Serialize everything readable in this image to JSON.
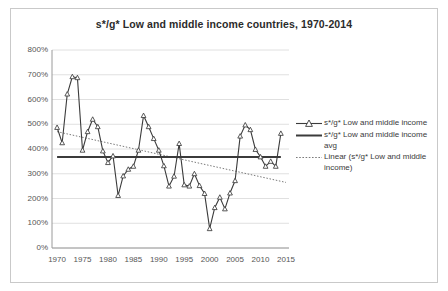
{
  "chart_data": {
    "type": "line",
    "title": "s*/g* Low and middle income countries, 1970-2014",
    "xlabel": "",
    "ylabel": "",
    "xlim": [
      1969,
      2015.6
    ],
    "ylim": [
      0,
      800
    ],
    "xticks": [
      "1970",
      "1975",
      "1980",
      "1985",
      "1990",
      "1995",
      "2000",
      "2005",
      "2010",
      "2015"
    ],
    "xtick_values": [
      1970,
      1975,
      1980,
      1985,
      1990,
      1995,
      2000,
      2005,
      2010,
      2015
    ],
    "yticks": [
      "0%",
      "100%",
      "200%",
      "300%",
      "400%",
      "500%",
      "600%",
      "700%",
      "800%"
    ],
    "ytick_values": [
      0,
      100,
      200,
      300,
      400,
      500,
      600,
      700,
      800
    ],
    "grid": true,
    "legend_position": "right",
    "x": [
      1970,
      1971,
      1972,
      1973,
      1974,
      1975,
      1976,
      1977,
      1978,
      1979,
      1980,
      1981,
      1982,
      1983,
      1984,
      1985,
      1986,
      1987,
      1988,
      1989,
      1990,
      1991,
      1992,
      1993,
      1994,
      1995,
      1996,
      1997,
      1998,
      1999,
      2000,
      2001,
      2002,
      2003,
      2004,
      2005,
      2006,
      2007,
      2008,
      2009,
      2010,
      2011,
      2012,
      2013,
      2014
    ],
    "series": [
      {
        "name": "s*/g* Low and middle income",
        "style": "line-markers",
        "marker": "triangle-open",
        "color": "#3b3b3b",
        "values": [
          487,
          425,
          622,
          692,
          688,
          395,
          470,
          520,
          490,
          392,
          345,
          372,
          212,
          291,
          318,
          330,
          395,
          535,
          490,
          442,
          395,
          332,
          250,
          290,
          422,
          255,
          250,
          300,
          252,
          220,
          78,
          163,
          205,
          158,
          222,
          272,
          452,
          497,
          478,
          398,
          368,
          330,
          350,
          330,
          463
        ]
      },
      {
        "name": "s*/g* Low and middle income avg",
        "style": "line",
        "color": "#3b3b3b",
        "constant": 368,
        "values": [
          368,
          368,
          368,
          368,
          368,
          368,
          368,
          368,
          368,
          368,
          368,
          368,
          368,
          368,
          368,
          368,
          368,
          368,
          368,
          368,
          368,
          368,
          368,
          368,
          368,
          368,
          368,
          368,
          368,
          368,
          368,
          368,
          368,
          368,
          368,
          368,
          368,
          368,
          368,
          368,
          368,
          368,
          368,
          368,
          368
        ]
      },
      {
        "name": "Linear (s*/g* Low and middle income)",
        "style": "dotted-trendline",
        "color": "#7a7a7a",
        "endpoints": [
          [
            1970,
            470
          ],
          [
            2015,
            265
          ]
        ]
      }
    ]
  },
  "legend": {
    "items": [
      {
        "label": "s*/g* Low and middle income",
        "key": "line-with-triangle-marker"
      },
      {
        "label": "s*/g* Low and middle income avg",
        "key": "solid-line"
      },
      {
        "label": "Linear (s*/g* Low and middle income)",
        "key": "dotted-line"
      }
    ]
  }
}
